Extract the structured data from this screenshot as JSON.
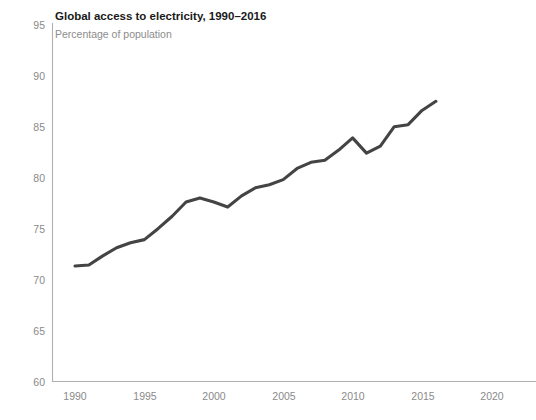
{
  "chart_data": {
    "type": "line",
    "title": "Global access to electricity, 1990–2016",
    "subtitle": "Percentage of population",
    "xlabel": "",
    "ylabel": "",
    "grid": false,
    "legend": "none",
    "xlim": [
      1988.5,
      2021.5
    ],
    "ylim": [
      60,
      95
    ],
    "xticks": [
      1990,
      1995,
      2000,
      2005,
      2010,
      2015,
      2020
    ],
    "yticks": [
      60,
      65,
      70,
      75,
      80,
      85,
      90,
      95
    ],
    "xtick_labels": [
      "1990",
      "1995",
      "2000",
      "2005",
      "2010",
      "2015",
      "2020"
    ],
    "ytick_labels": [
      "60",
      "65",
      "70",
      "75",
      "80",
      "85",
      "90",
      "95"
    ],
    "series": [
      {
        "name": "Access to electricity (% of population)",
        "color": "#444444",
        "x": [
          1990,
          1991,
          1992,
          1993,
          1994,
          1995,
          1996,
          1997,
          1998,
          1999,
          2000,
          2001,
          2002,
          2003,
          2004,
          2005,
          2006,
          2007,
          2008,
          2009,
          2010,
          2011,
          2012,
          2013,
          2014,
          2015,
          2016
        ],
        "values": [
          71.3,
          71.4,
          72.3,
          73.1,
          73.6,
          73.9,
          75.0,
          76.2,
          77.6,
          78.0,
          77.6,
          77.1,
          78.2,
          79.0,
          79.3,
          79.8,
          80.9,
          81.5,
          81.7,
          82.7,
          83.9,
          82.4,
          83.1,
          85.0,
          85.2,
          86.6,
          87.5
        ]
      }
    ]
  },
  "colors": {
    "line": "#444444",
    "axis": "#b0b0b0",
    "tick_text": "#8a8a8a",
    "title_text": "#1a1a1a",
    "subtitle_text": "#8c8c8c",
    "background": "#ffffff"
  }
}
